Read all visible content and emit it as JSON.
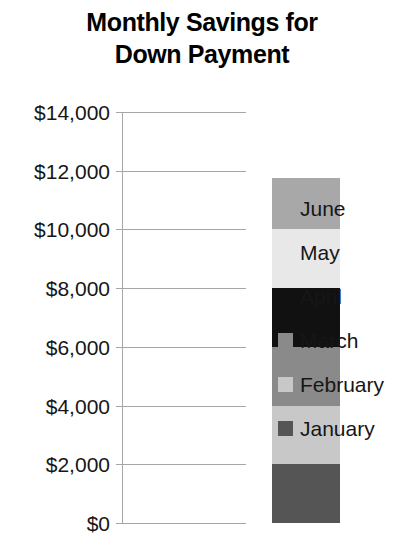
{
  "chart_data": {
    "type": "bar",
    "subtype": "stacked-column",
    "title": "Monthly Savings for\nDown Payment",
    "title_lines": [
      "Monthly Savings for",
      "Down Payment"
    ],
    "xlabel": "",
    "ylabel": "",
    "ylim": [
      0,
      14000
    ],
    "ytick_step": 2000,
    "ytick_labels": [
      "$14,000",
      "$12,000",
      "$10,000",
      "$8,000",
      "$6,000",
      "$4,000",
      "$2,000",
      "$0"
    ],
    "ytick_values": [
      14000,
      12000,
      10000,
      8000,
      6000,
      4000,
      2000,
      0
    ],
    "grid": true,
    "grid_axis": "y",
    "legend_position": "right",
    "categories": [
      "Down Payment"
    ],
    "stack_order_bottom_to_top": [
      "January",
      "February",
      "March",
      "April",
      "May",
      "June"
    ],
    "series": [
      {
        "name": "January",
        "values": [
          2000
        ],
        "color": "#555555"
      },
      {
        "name": "February",
        "values": [
          2000
        ],
        "color": "#c8c8c8"
      },
      {
        "name": "March",
        "values": [
          2000
        ],
        "color": "#8a8a8a"
      },
      {
        "name": "April",
        "values": [
          2000
        ],
        "color": "#111111"
      },
      {
        "name": "May",
        "values": [
          2000
        ],
        "color": "#e8e8e8"
      },
      {
        "name": "June",
        "values": [
          1750
        ],
        "color": "#a8a8a8"
      }
    ],
    "stack_total": 11750,
    "segments_bottom_to_top": [
      {
        "label": "January",
        "start": 0,
        "end": 2000,
        "value": 2000,
        "color": "#555555"
      },
      {
        "label": "February",
        "start": 2000,
        "end": 4000,
        "value": 2000,
        "color": "#c8c8c8"
      },
      {
        "label": "March",
        "start": 4000,
        "end": 6000,
        "value": 2000,
        "color": "#8a8a8a"
      },
      {
        "label": "April",
        "start": 6000,
        "end": 8000,
        "value": 2000,
        "color": "#111111"
      },
      {
        "label": "May",
        "start": 8000,
        "end": 10000,
        "value": 2000,
        "color": "#e8e8e8"
      },
      {
        "label": "June",
        "start": 10000,
        "end": 11750,
        "value": 1750,
        "color": "#a8a8a8"
      }
    ],
    "legend_entries_top_to_bottom": [
      {
        "label": "June",
        "color": "#a8a8a8"
      },
      {
        "label": "May",
        "color": "#e8e8e8"
      },
      {
        "label": "April",
        "color": "#111111"
      },
      {
        "label": "March",
        "color": "#8a8a8a"
      },
      {
        "label": "February",
        "color": "#c8c8c8"
      },
      {
        "label": "January",
        "color": "#555555"
      }
    ],
    "axis_color": "#a6a6a6",
    "text_color": "#161616"
  }
}
